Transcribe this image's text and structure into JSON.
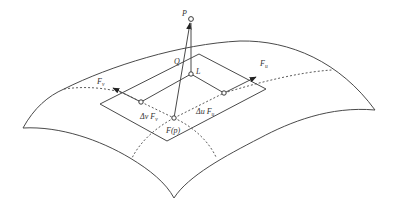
{
  "diagram": {
    "labels": {
      "P": "P",
      "Q": "Q",
      "L": "L",
      "Fu": "F",
      "Fu_sub": "u",
      "Fv": "F",
      "Fv_sub": "v",
      "du_prefix": "Δu F",
      "du_sub": "u",
      "dv_prefix": "Δv F",
      "dv_sub": "v",
      "Fp": "F(p)"
    },
    "colors": {
      "stroke": "#4a4a4a",
      "text": "#333333",
      "background": "#ffffff"
    }
  }
}
